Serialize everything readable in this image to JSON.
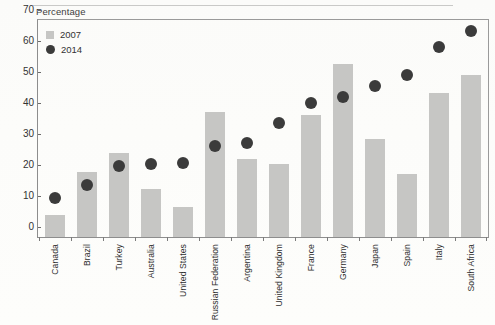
{
  "page": {
    "background_color": "#fdfdfb",
    "top_cutoff_text": ""
  },
  "chart_data": {
    "type": "bar",
    "title": "",
    "subtitle": "",
    "xlabel": "",
    "ylabel": "Percentage",
    "ylim": [
      0,
      70
    ],
    "yticks": [
      0,
      10,
      20,
      30,
      40,
      50,
      60,
      70
    ],
    "grid": false,
    "legend_position": "top-left",
    "categories": [
      "Canada",
      "Brazil",
      "Turkey",
      "Australia",
      "United States",
      "Russian Federation",
      "Argentina",
      "United Kingdom",
      "France",
      "Germany",
      "Japan",
      "Spain",
      "Italy",
      "South Africa"
    ],
    "series": [
      {
        "name": "2007",
        "mark": "bar",
        "color": "#c6c6c4",
        "values": [
          7.0,
          21.0,
          27.0,
          15.4,
          9.8,
          40.4,
          25.1,
          23.5,
          39.5,
          55.8,
          31.7,
          20.2,
          46.4,
          52.2
        ]
      },
      {
        "name": "2014",
        "mark": "dot",
        "color": "#3b3b3b",
        "values": [
          12.6,
          16.8,
          23.0,
          23.4,
          23.8,
          29.5,
          30.4,
          36.7,
          43.2,
          45.3,
          48.7,
          52.4,
          61.3,
          66.3
        ]
      }
    ]
  },
  "legend": {
    "items": [
      {
        "label": "2007",
        "marker": "square-swatch",
        "color": "#c6c6c4"
      },
      {
        "label": "2014",
        "marker": "dot-swatch",
        "color": "#3b3b3b"
      }
    ]
  },
  "axis": {
    "y_title": "Percentage"
  }
}
